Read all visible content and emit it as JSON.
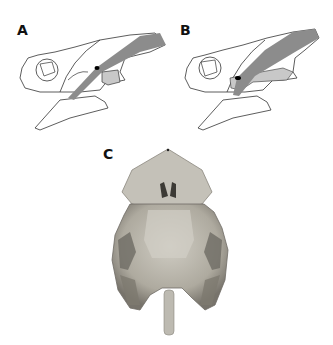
{
  "figure": {
    "panels": [
      {
        "label": "A",
        "description": "Lateral line drawing of skull with shaded muscle band and shaded region"
      },
      {
        "label": "B",
        "description": "Lateral line drawing of skull with shaded muscle band and shaded region"
      },
      {
        "label": "C",
        "description": "Ventral photograph of skull"
      }
    ]
  },
  "colors": {
    "line": "#333333",
    "muscle_band": "#8c8c8c",
    "shaded_region": "#c8c8c8",
    "photo_bone": "#b9b6ad",
    "photo_dark": "#6e6b64",
    "marker": "#000000"
  }
}
